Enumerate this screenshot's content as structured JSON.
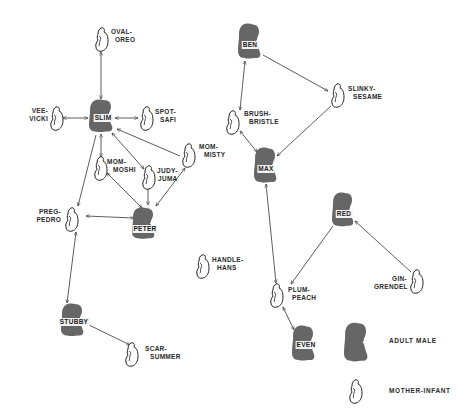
{
  "colors": {
    "background": "#ffffff",
    "adult_male_fill": "#666666",
    "mother_infant_stroke": "#222222",
    "edge_stroke": "#333333"
  },
  "nodes": {
    "slim": {
      "type": "adult_male",
      "name": "SLIM"
    },
    "peter": {
      "type": "adult_male",
      "name": "PETER"
    },
    "stubby": {
      "type": "adult_male",
      "name": "STUBBY"
    },
    "ben": {
      "type": "adult_male",
      "name": "BEN"
    },
    "max": {
      "type": "adult_male",
      "name": "MAX"
    },
    "red": {
      "type": "adult_male",
      "name": "RED"
    },
    "even": {
      "type": "adult_male",
      "name": "EVEN"
    },
    "oval_oreo": {
      "type": "mother_infant",
      "line1": "OVAL-",
      "line2": "OREO"
    },
    "vee_vicki": {
      "type": "mother_infant",
      "line1": "VEE-",
      "line2": "VICKI"
    },
    "spot_safi": {
      "type": "mother_infant",
      "line1": "SPOT-",
      "line2": "SAFI"
    },
    "mom_moshi": {
      "type": "mother_infant",
      "line1": "MOM-",
      "line2": "MOSHI"
    },
    "judy_juma": {
      "type": "mother_infant",
      "line1": "JUDY-",
      "line2": "JUMA"
    },
    "mom_misty": {
      "type": "mother_infant",
      "line1": "MOM-",
      "line2": "MISTY"
    },
    "preg_pedro": {
      "type": "mother_infant",
      "line1": "PREG-",
      "line2": "PEDRO"
    },
    "scar_summer": {
      "type": "mother_infant",
      "line1": "SCAR-",
      "line2": "SUMMER"
    },
    "handle_hans": {
      "type": "mother_infant",
      "line1": "HANDLE-",
      "line2": "HANS"
    },
    "brush_bristle": {
      "type": "mother_infant",
      "line1": "BRUSH-",
      "line2": "BRISTLE"
    },
    "slinky_sesame": {
      "type": "mother_infant",
      "line1": "SLINKY-",
      "line2": "SESAME"
    },
    "plum_peach": {
      "type": "mother_infant",
      "line1": "PLUM-",
      "line2": "PEACH"
    },
    "gin_grendel": {
      "type": "mother_infant",
      "line1": "GIN-",
      "line2": "GRENDEL"
    }
  },
  "edges": [
    {
      "from": "oval_oreo",
      "to": "slim",
      "direction": "both"
    },
    {
      "from": "vee_vicki",
      "to": "slim",
      "direction": "both"
    },
    {
      "from": "slim",
      "to": "spot_safi",
      "direction": "both"
    },
    {
      "from": "slim",
      "to": "mom_moshi",
      "direction": "both"
    },
    {
      "from": "slim",
      "to": "judy_juma",
      "direction": "both"
    },
    {
      "from": "mom_misty",
      "to": "slim",
      "direction": "forward"
    },
    {
      "from": "slim",
      "to": "preg_pedro",
      "direction": "forward"
    },
    {
      "from": "mom_moshi",
      "to": "peter",
      "direction": "both"
    },
    {
      "from": "judy_juma",
      "to": "peter",
      "direction": "both"
    },
    {
      "from": "peter",
      "to": "mom_misty",
      "direction": "both"
    },
    {
      "from": "preg_pedro",
      "to": "peter",
      "direction": "both"
    },
    {
      "from": "preg_pedro",
      "to": "stubby",
      "direction": "both"
    },
    {
      "from": "stubby",
      "to": "scar_summer",
      "direction": "both"
    },
    {
      "from": "ben",
      "to": "brush_bristle",
      "direction": "both"
    },
    {
      "from": "ben",
      "to": "slinky_sesame",
      "direction": "forward"
    },
    {
      "from": "slinky_sesame",
      "to": "max",
      "direction": "forward"
    },
    {
      "from": "brush_bristle",
      "to": "max",
      "direction": "both"
    },
    {
      "from": "max",
      "to": "plum_peach",
      "direction": "both"
    },
    {
      "from": "red",
      "to": "plum_peach",
      "direction": "forward"
    },
    {
      "from": "gin_grendel",
      "to": "red",
      "direction": "forward"
    },
    {
      "from": "plum_peach",
      "to": "even",
      "direction": "both"
    }
  ],
  "legend": {
    "adult_male": "ADULT MALE",
    "mother_infant": "MOTHER-INFANT"
  }
}
